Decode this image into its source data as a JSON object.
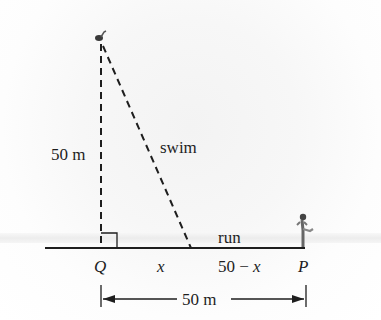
{
  "diagram": {
    "labels": {
      "vertical_distance": "50 m",
      "swim": "swim",
      "run": "run",
      "point_q": "Q",
      "point_p": "P",
      "segment_x": "x",
      "segment_remaining": "50 − x",
      "horizontal_distance": "50 m"
    },
    "icons": {
      "swimmer": "swimmer-figure",
      "runner": "runner-figure",
      "right_angle": "right-angle-marker"
    },
    "colors": {
      "line": "#1e1e1e",
      "background": "#f5f5f5"
    }
  }
}
